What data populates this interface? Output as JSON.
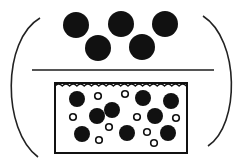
{
  "diagram": {
    "colors": {
      "ink": "#111111",
      "line": "#555555",
      "background": "#ffffff"
    },
    "top_particles": [
      {
        "cx": 76,
        "cy": 25,
        "r": 13
      },
      {
        "cx": 121,
        "cy": 24,
        "r": 13
      },
      {
        "cx": 165,
        "cy": 24,
        "r": 13
      },
      {
        "cx": 98,
        "cy": 48,
        "r": 13
      },
      {
        "cx": 142,
        "cy": 47,
        "r": 13
      }
    ],
    "divider": {
      "x1": 32,
      "y1": 70,
      "x2": 214,
      "y2": 70
    },
    "container": {
      "x": 55,
      "y": 83,
      "width": 132,
      "height": 70
    },
    "large_particles": [
      {
        "cx": 77,
        "cy": 99
      },
      {
        "cx": 112,
        "cy": 110
      },
      {
        "cx": 143,
        "cy": 98
      },
      {
        "cx": 171,
        "cy": 101
      },
      {
        "cx": 97,
        "cy": 116
      },
      {
        "cx": 155,
        "cy": 116
      },
      {
        "cx": 82,
        "cy": 134
      },
      {
        "cx": 127,
        "cy": 133
      },
      {
        "cx": 168,
        "cy": 133
      }
    ],
    "small_particles": [
      {
        "cx": 98,
        "cy": 96
      },
      {
        "cx": 125,
        "cy": 94
      },
      {
        "cx": 73,
        "cy": 117
      },
      {
        "cx": 109,
        "cy": 127
      },
      {
        "cx": 137,
        "cy": 117
      },
      {
        "cx": 176,
        "cy": 118
      },
      {
        "cx": 99,
        "cy": 140
      },
      {
        "cx": 147,
        "cy": 132
      },
      {
        "cx": 154,
        "cy": 143
      }
    ]
  }
}
